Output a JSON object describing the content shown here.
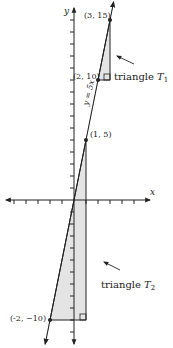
{
  "chart_data": {
    "type": "line",
    "title": "",
    "xlabel": "x",
    "ylabel": "y",
    "xlim": [
      -6,
      6
    ],
    "ylim": [
      -12,
      16
    ],
    "grid": false,
    "line": {
      "label": "y = 5x",
      "slope": 5,
      "intercept": 0
    },
    "points": [
      {
        "x": 3,
        "y": 15,
        "label": "(3, 15)"
      },
      {
        "x": 2,
        "y": 10,
        "label": "(2, 10)"
      },
      {
        "x": 1,
        "y": 5,
        "label": "(1, 5)"
      },
      {
        "x": -2,
        "y": -10,
        "label": "(-2, −10)"
      }
    ],
    "triangles": [
      {
        "name": "T1",
        "label": "triangle",
        "sub": "1",
        "vertices": [
          [
            2,
            10
          ],
          [
            3,
            15
          ],
          [
            3,
            10
          ]
        ],
        "right_angle": [
          3,
          10
        ]
      },
      {
        "name": "T2",
        "label": "triangle",
        "sub": "2",
        "vertices": [
          [
            -2,
            -10
          ],
          [
            1,
            5
          ],
          [
            1,
            -10
          ]
        ],
        "right_angle": [
          1,
          -10
        ]
      }
    ],
    "colors": {
      "fill": "#e4e4e4",
      "stroke": "#222222"
    }
  }
}
